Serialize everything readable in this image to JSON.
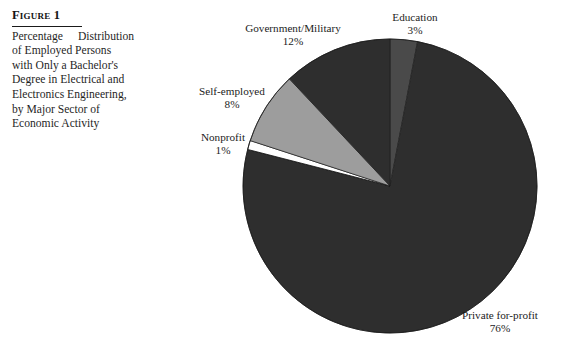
{
  "figure": {
    "label": "Figure 1",
    "caption_lines": [
      "Percentage Distribution",
      "of Employed Persons",
      "with Only a Bachelor's",
      "Degree in Electrical and",
      "Electronics Engineering,",
      "by Major Sector of",
      "Economic Activity"
    ],
    "caption_full": "Percentage Distribution of Employed Persons with Only a Bachelor's Degree in Electrical and Electronics Engineering, by Major Sector of Economic Activity"
  },
  "labels": {
    "government": {
      "name": "Government/Military",
      "pct": "12%"
    },
    "education": {
      "name": "Education",
      "pct": "3%"
    },
    "selfemployed": {
      "name": "Self-employed",
      "pct": "8%"
    },
    "nonprofit": {
      "name": "Nonprofit",
      "pct": "1%"
    },
    "private": {
      "name": "Private for-profit",
      "pct": "76%"
    }
  },
  "chart_data": {
    "type": "pie",
    "xlabel": "",
    "ylabel": "",
    "units": "percent",
    "start_angle_deg": 0,
    "direction": "clockwise",
    "legend": "none",
    "grid": false,
    "labels_on_slices": false,
    "categories": [
      "Education",
      "Private for-profit",
      "Nonprofit",
      "Self-employed",
      "Government/Military"
    ],
    "values": [
      3,
      76,
      1,
      8,
      12
    ],
    "slices": [
      {
        "name": "Education",
        "value": 3,
        "display": "3%",
        "color": "#4a4a4a",
        "start_deg": 0.0,
        "end_deg": 10.8
      },
      {
        "name": "Private for-profit",
        "value": 76,
        "display": "76%",
        "color": "#2e2e2e",
        "start_deg": 10.8,
        "end_deg": 284.4
      },
      {
        "name": "Nonprofit",
        "value": 1,
        "display": "1%",
        "color": "#ffffff",
        "start_deg": 284.4,
        "end_deg": 288.0
      },
      {
        "name": "Self-employed",
        "value": 8,
        "display": "8%",
        "color": "#9d9d9d",
        "start_deg": 288.0,
        "end_deg": 316.8
      },
      {
        "name": "Government/Military",
        "value": 12,
        "display": "12%",
        "color": "#2e2e2e",
        "start_deg": 316.8,
        "end_deg": 360.0
      }
    ],
    "geometry": {
      "cx": 390,
      "cy": 186,
      "r": 147
    },
    "colors": {
      "dark": "#2e2e2e",
      "mid": "#4a4a4a",
      "light": "#9d9d9d",
      "white": "#ffffff",
      "outline": "#1a1a1a",
      "text": "#1c1c1c"
    }
  }
}
